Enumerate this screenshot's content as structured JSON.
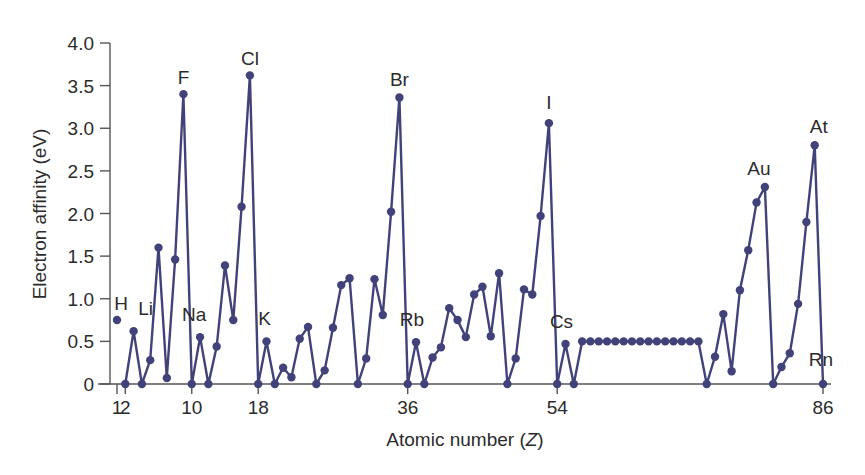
{
  "chart_data": {
    "type": "line",
    "title": "",
    "xlabel": "Atomic number (Z)",
    "ylabel": "Electron affinity (eV)",
    "ylim": [
      0,
      4.0
    ],
    "xlim": [
      1,
      86
    ],
    "grid": false,
    "legend": null,
    "yticks": [
      {
        "value": 0,
        "label": "0"
      },
      {
        "value": 0.5,
        "label": "0.5"
      },
      {
        "value": 1.0,
        "label": "1.0"
      },
      {
        "value": 1.5,
        "label": "1.5"
      },
      {
        "value": 2.0,
        "label": "2.0"
      },
      {
        "value": 2.5,
        "label": "2.5"
      },
      {
        "value": 3.0,
        "label": "3.0"
      },
      {
        "value": 3.5,
        "label": "3.5"
      },
      {
        "value": 4.0,
        "label": "4.0"
      }
    ],
    "xticks": [
      {
        "value": 1,
        "label": "1"
      },
      {
        "value": 2,
        "label": "2"
      },
      {
        "value": 10,
        "label": "10"
      },
      {
        "value": 18,
        "label": "18"
      },
      {
        "value": 36,
        "label": "36"
      },
      {
        "value": 54,
        "label": "54"
      },
      {
        "value": 86,
        "label": "86"
      }
    ],
    "series": [
      {
        "name": "Electron affinity",
        "color": "#41427a",
        "isolated_points": [
          1
        ],
        "x": [
          1,
          2,
          3,
          4,
          5,
          6,
          7,
          8,
          9,
          10,
          11,
          12,
          13,
          14,
          15,
          16,
          17,
          18,
          19,
          20,
          21,
          22,
          23,
          24,
          25,
          26,
          27,
          28,
          29,
          30,
          31,
          32,
          33,
          34,
          35,
          36,
          37,
          38,
          39,
          40,
          41,
          42,
          43,
          44,
          45,
          46,
          47,
          48,
          49,
          50,
          51,
          52,
          53,
          54,
          55,
          56,
          57,
          58,
          59,
          60,
          61,
          62,
          63,
          64,
          65,
          66,
          67,
          68,
          69,
          70,
          71,
          72,
          73,
          74,
          75,
          76,
          77,
          78,
          79,
          80,
          81,
          82,
          83,
          84,
          85,
          86
        ],
        "values": [
          0.75,
          0,
          0.62,
          0,
          0.28,
          1.6,
          0.07,
          1.46,
          3.4,
          0,
          0.55,
          0,
          0.44,
          1.39,
          0.75,
          2.08,
          3.62,
          0,
          0.5,
          0,
          0.19,
          0.08,
          0.53,
          0.67,
          0,
          0.16,
          0.66,
          1.16,
          1.24,
          0,
          0.3,
          1.23,
          0.81,
          2.02,
          3.36,
          0,
          0.49,
          0,
          0.31,
          0.43,
          0.89,
          0.75,
          0.55,
          1.05,
          1.14,
          0.56,
          1.3,
          0,
          0.3,
          1.11,
          1.05,
          1.97,
          3.06,
          0,
          0.47,
          0,
          0.5,
          0.5,
          0.5,
          0.5,
          0.5,
          0.5,
          0.5,
          0.5,
          0.5,
          0.5,
          0.5,
          0.5,
          0.5,
          0.5,
          0.5,
          0,
          0.32,
          0.82,
          0.15,
          1.1,
          1.57,
          2.13,
          2.31,
          0,
          0.2,
          0.36,
          0.94,
          1.9,
          2.8,
          0
        ]
      }
    ],
    "annotations": [
      {
        "text": "H",
        "z": 1
      },
      {
        "text": "Li",
        "z": 3
      },
      {
        "text": "F",
        "z": 9
      },
      {
        "text": "Na",
        "z": 11
      },
      {
        "text": "Cl",
        "z": 17
      },
      {
        "text": "K",
        "z": 19
      },
      {
        "text": "Br",
        "z": 35
      },
      {
        "text": "Rb",
        "z": 37
      },
      {
        "text": "I",
        "z": 53
      },
      {
        "text": "Cs",
        "z": 55
      },
      {
        "text": "Au",
        "z": 79
      },
      {
        "text": "At",
        "z": 85
      },
      {
        "text": "Rn",
        "z": 86
      }
    ]
  },
  "axes": {
    "x_title_main": "Atomic number (",
    "x_title_var": "Z",
    "x_title_end": ")",
    "y_title": "Electron affinity (eV)"
  },
  "colors": {
    "series": "#41427a",
    "axis": "#555555",
    "text": "#2b2b2b"
  }
}
